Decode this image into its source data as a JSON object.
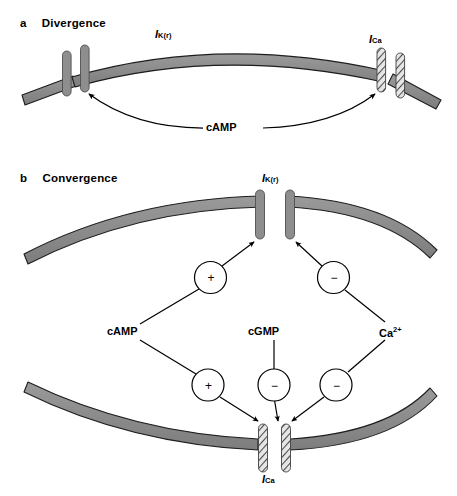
{
  "figure": {
    "panels": [
      {
        "letter": "a",
        "title": "Divergence",
        "channels": [
          {
            "name": "I_K(r)",
            "italic_i": "I",
            "subscript": "K(r)",
            "style": "solid-gray"
          },
          {
            "name": "I_Ca",
            "italic_i": "I",
            "subscript": "Ca",
            "style": "hatched"
          }
        ],
        "messengers": [
          {
            "label": "cAMP",
            "targets": [
              "I_K(r)",
              "I_Ca"
            ],
            "arrow": "double-headed-arc"
          }
        ]
      },
      {
        "letter": "b",
        "title": "Convergence",
        "channels": [
          {
            "name": "I_K(r)",
            "italic_i": "I",
            "subscript": "K(r)",
            "style": "solid-gray",
            "position": "top-membrane"
          },
          {
            "name": "I_Ca",
            "italic_i": "I",
            "subscript": "Ca",
            "style": "hatched",
            "position": "bottom-membrane"
          }
        ],
        "messengers": [
          {
            "label": "cAMP",
            "plain": "cAMP"
          },
          {
            "label": "cGMP",
            "plain": "cGMP"
          },
          {
            "label": "Ca2+",
            "base": "Ca",
            "superscript": "2+"
          }
        ],
        "modulation_nodes": [
          {
            "id": "camp-to-k",
            "sign": "+",
            "from": "cAMP",
            "to": "I_K(r)"
          },
          {
            "id": "ca-to-k",
            "sign": "−",
            "from": "Ca2+",
            "to": "I_K(r)"
          },
          {
            "id": "camp-to-ca",
            "sign": "+",
            "from": "cAMP",
            "to": "I_Ca"
          },
          {
            "id": "cgmp-to-ca",
            "sign": "−",
            "from": "cGMP",
            "to": "I_Ca"
          },
          {
            "id": "ca-to-ca",
            "sign": "−",
            "from": "Ca2+",
            "to": "I_Ca"
          }
        ]
      }
    ],
    "colors": {
      "membrane_fill": "#8c8c8c",
      "membrane_stroke": "#1a1a1a",
      "channel_fill": "#8c8c8c",
      "channel_stroke": "#4d4d4d",
      "hatch_stroke": "#555555",
      "line": "#000000",
      "background": "#ffffff"
    }
  }
}
